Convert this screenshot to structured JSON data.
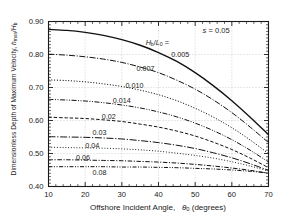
{
  "chart_data": {
    "type": "line",
    "title": "",
    "xlabel": "Offshore Incident Angle,  θ₀ (degrees)",
    "ylabel": "Dimensionless Depth of Maximum Velocity,  hₘₓₐ/Hₑ",
    "xlim": [
      10,
      70
    ],
    "ylim": [
      0.4,
      0.9
    ],
    "xticks": [
      10,
      20,
      30,
      40,
      50,
      60,
      70
    ],
    "yticks": [
      0.4,
      0.5,
      0.6,
      0.7,
      0.8,
      0.9
    ],
    "xtick_labels": [
      "10",
      "20",
      "30",
      "40",
      "50",
      "60",
      "70"
    ],
    "ytick_labels": [
      "0.40",
      "0.50",
      "0.60",
      "0.70",
      "0.80",
      "0.90"
    ],
    "x_minor_tick_step": 2,
    "y_minor_tick_step": 0.01,
    "grid": true,
    "grid_style": "dotted",
    "legend_position": "inline-curve-labels",
    "annotations": [
      {
        "name": "slope-annotation",
        "text": "s = 0.05",
        "x": 52.0,
        "y": 0.872
      },
      {
        "name": "series-group-header",
        "text": "Hₑ/L₀ =",
        "x": 36.5,
        "y": 0.836
      }
    ],
    "x": [
      10,
      15,
      20,
      25,
      30,
      35,
      40,
      45,
      50,
      55,
      60,
      65,
      70
    ],
    "series": [
      {
        "name": "0.005",
        "label": "0.005",
        "style": "solid",
        "label_x": 43.5,
        "label_y": 0.8,
        "values": [
          0.876,
          0.873,
          0.867,
          0.858,
          0.845,
          0.828,
          0.806,
          0.779,
          0.745,
          0.705,
          0.66,
          0.61,
          0.557
        ]
      },
      {
        "name": "0.007",
        "label": "0.007",
        "style": "dashdot",
        "label_x": 34.0,
        "label_y": 0.757,
        "values": [
          0.801,
          0.798,
          0.793,
          0.786,
          0.776,
          0.762,
          0.745,
          0.722,
          0.695,
          0.662,
          0.624,
          0.58,
          0.533
        ]
      },
      {
        "name": "0.010",
        "label": "0.010",
        "style": "dotted",
        "label_x": 31.0,
        "label_y": 0.706,
        "values": [
          0.723,
          0.721,
          0.717,
          0.711,
          0.703,
          0.692,
          0.678,
          0.66,
          0.637,
          0.61,
          0.578,
          0.541,
          0.5
        ]
      },
      {
        "name": "0.014",
        "label": "0.014",
        "style": "dashdotdot",
        "label_x": 27.5,
        "label_y": 0.66,
        "values": [
          0.664,
          0.662,
          0.659,
          0.654,
          0.647,
          0.638,
          0.626,
          0.611,
          0.592,
          0.569,
          0.542,
          0.51,
          0.474
        ]
      },
      {
        "name": "0.02",
        "label": "0.02",
        "style": "dashed",
        "label_x": 24.5,
        "label_y": 0.611,
        "values": [
          0.61,
          0.608,
          0.606,
          0.602,
          0.597,
          0.589,
          0.58,
          0.568,
          0.553,
          0.534,
          0.512,
          0.486,
          0.457
        ]
      },
      {
        "name": "0.03",
        "label": "0.03",
        "style": "dashdot-long",
        "label_x": 22.0,
        "label_y": 0.562,
        "values": [
          0.551,
          0.55,
          0.549,
          0.547,
          0.544,
          0.539,
          0.533,
          0.525,
          0.515,
          0.502,
          0.487,
          0.469,
          0.449
        ]
      },
      {
        "name": "0.04",
        "label": "0.04",
        "style": "fine-dotted",
        "label_x": 20.0,
        "label_y": 0.522,
        "values": [
          0.519,
          0.518,
          0.517,
          0.516,
          0.514,
          0.511,
          0.507,
          0.501,
          0.494,
          0.486,
          0.475,
          0.462,
          0.447
        ]
      },
      {
        "name": "0.06",
        "label": "0.06",
        "style": "dashdot-med",
        "label_x": 17.5,
        "label_y": 0.485,
        "values": [
          0.481,
          0.481,
          0.48,
          0.479,
          0.478,
          0.476,
          0.474,
          0.471,
          0.467,
          0.462,
          0.456,
          0.449,
          0.44
        ]
      },
      {
        "name": "0.08",
        "label": "0.08",
        "style": "dashdotdot-med",
        "label_x": 22.0,
        "label_y": 0.44,
        "values": [
          0.46,
          0.46,
          0.46,
          0.46,
          0.459,
          0.459,
          0.458,
          0.457,
          0.455,
          0.453,
          0.45,
          0.446,
          0.441
        ]
      }
    ]
  },
  "axis": {
    "y_label_prefix": "Dimensionless Depth of Maximum Velocity,",
    "y_label_symbol_num": "h",
    "y_label_symbol_num_sub": "mxa",
    "y_label_symbol_den": "H",
    "y_label_symbol_den_sub": "b",
    "x_label_prefix": "Offshore Incident Angle,",
    "x_label_symbol": "θ",
    "x_label_symbol_sub": "0",
    "x_label_suffix": "(degrees)"
  },
  "annotations": {
    "slope_symbol": "s",
    "slope_eq": "= 0.05",
    "group_num": "H",
    "group_num_sub": "b",
    "group_den": "L",
    "group_den_sub": "0",
    "group_eq": "="
  },
  "colors": {
    "axis": "#1a1a1a",
    "grid": "#b4b4b4",
    "curve": "#111111",
    "background": "#ffffff"
  }
}
